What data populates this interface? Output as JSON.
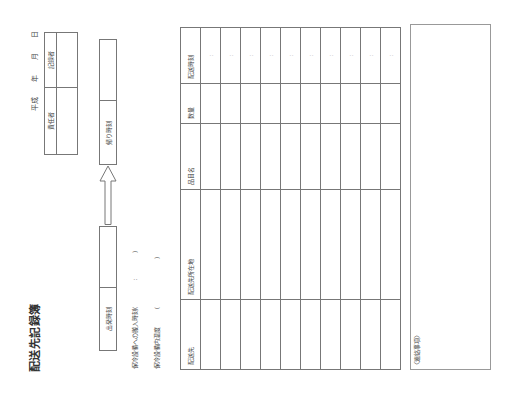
{
  "document": {
    "title": "配送先記録簿",
    "date_label": {
      "era": "平成",
      "year": "年",
      "month": "月",
      "day": "日"
    },
    "signoff_box": {
      "responsible_label": "責任者",
      "recorder_label": "記録者"
    },
    "time_flow": {
      "departure_label": "出発時刻",
      "return_label": "帰り時刻",
      "arrow_icon": "arrow-up-icon"
    },
    "storage": {
      "carry_in_time_label": "保冷設備への搬入時刻(",
      "carry_in_time_sep": ":",
      "carry_in_time_close": ")",
      "temperature_label": "保冷設備内温度",
      "temperature_open": "(",
      "temperature_close": ")"
    },
    "table": {
      "columns": [
        "配送先",
        "配送先所在地",
        "品目名",
        "数量",
        "配送時刻"
      ],
      "rows": [
        {
          "destination": "",
          "address": "",
          "item": "",
          "quantity": "",
          "time": ":"
        },
        {
          "destination": "",
          "address": "",
          "item": "",
          "quantity": "",
          "time": ":"
        },
        {
          "destination": "",
          "address": "",
          "item": "",
          "quantity": "",
          "time": ":"
        },
        {
          "destination": "",
          "address": "",
          "item": "",
          "quantity": "",
          "time": ":"
        },
        {
          "destination": "",
          "address": "",
          "item": "",
          "quantity": "",
          "time": ":"
        },
        {
          "destination": "",
          "address": "",
          "item": "",
          "quantity": "",
          "time": ":"
        },
        {
          "destination": "",
          "address": "",
          "item": "",
          "quantity": "",
          "time": ":"
        },
        {
          "destination": "",
          "address": "",
          "item": "",
          "quantity": "",
          "time": ":"
        },
        {
          "destination": "",
          "address": "",
          "item": "",
          "quantity": "",
          "time": ":"
        },
        {
          "destination": "",
          "address": "",
          "item": "",
          "quantity": "",
          "time": ":"
        }
      ]
    },
    "notes": {
      "label": "〈連絡事項〉",
      "value": ""
    },
    "colors": {
      "line": "#777777",
      "text": "#333333",
      "background": "#ffffff"
    }
  }
}
